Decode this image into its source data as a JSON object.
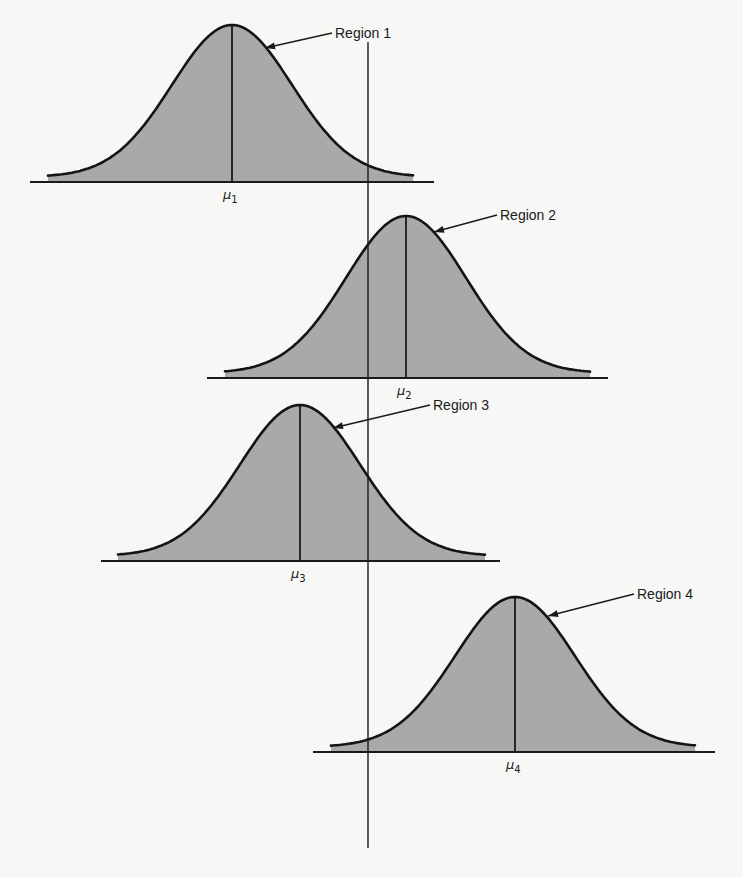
{
  "figure": {
    "axis": {
      "x": 368,
      "y_top": 42,
      "y_bottom": 848
    },
    "fill_color": "#a9a9a9",
    "line_color": "#141414",
    "background_color": "#f7f7f5",
    "curves": [
      {
        "region_label": "Region 1",
        "mean_symbol": "μ",
        "mean_subscript": "1",
        "center_x": 232,
        "peak_y": 25,
        "base_y": 182,
        "sigma": 60,
        "tail_left": 48,
        "tail_right": 413,
        "baseline_left": 30,
        "baseline_right": 434,
        "label_x": 335,
        "label_y": 38,
        "arrow_from": [
          332,
          33
        ],
        "arrow_to": [
          265,
          48
        ]
      },
      {
        "region_label": "Region 2",
        "mean_symbol": "μ",
        "mean_subscript": "2",
        "center_x": 406,
        "peak_y": 216,
        "base_y": 378,
        "sigma": 60,
        "tail_left": 225,
        "tail_right": 590,
        "baseline_left": 207,
        "baseline_right": 608,
        "label_x": 500,
        "label_y": 220,
        "arrow_from": [
          497,
          215
        ],
        "arrow_to": [
          434,
          232
        ]
      },
      {
        "region_label": "Region 3",
        "mean_symbol": "μ",
        "mean_subscript": "3",
        "center_x": 300,
        "peak_y": 405,
        "base_y": 561,
        "sigma": 60,
        "tail_left": 118,
        "tail_right": 485,
        "baseline_left": 101,
        "baseline_right": 500,
        "label_x": 433,
        "label_y": 410,
        "arrow_from": [
          430,
          405
        ],
        "arrow_to": [
          333,
          428
        ]
      },
      {
        "region_label": "Region 4",
        "mean_symbol": "μ",
        "mean_subscript": "4",
        "center_x": 515,
        "peak_y": 597,
        "base_y": 752,
        "sigma": 60,
        "tail_left": 331,
        "tail_right": 695,
        "baseline_left": 313,
        "baseline_right": 715,
        "label_x": 637,
        "label_y": 599,
        "arrow_from": [
          634,
          594
        ],
        "arrow_to": [
          548,
          616
        ]
      }
    ]
  }
}
